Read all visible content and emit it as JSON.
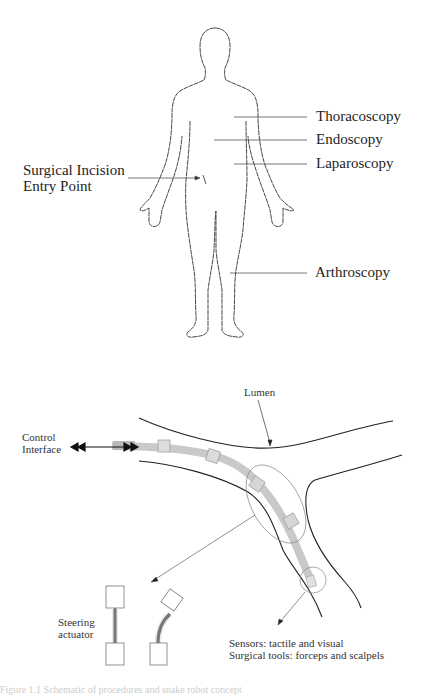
{
  "body_figure": {
    "labels": {
      "thoracoscopy": "Thoracoscopy",
      "endoscopy": "Endoscopy",
      "laparoscopy": "Laparoscopy",
      "arthroscopy": "Arthroscopy",
      "incision_line1": "Surgical Incision",
      "incision_line2": "Entry Point"
    }
  },
  "robot_figure": {
    "labels": {
      "lumen": "Lumen",
      "control_line1": "Control",
      "control_line2": "Interface",
      "steering_line1": "Steering",
      "steering_line2": "actuator",
      "sensors": "Sensors: tactile and visual",
      "tools": "Surgical tools: forceps and scalpels"
    }
  },
  "caption": "Figure 1.1 Schematic of procedures and snake robot concept"
}
